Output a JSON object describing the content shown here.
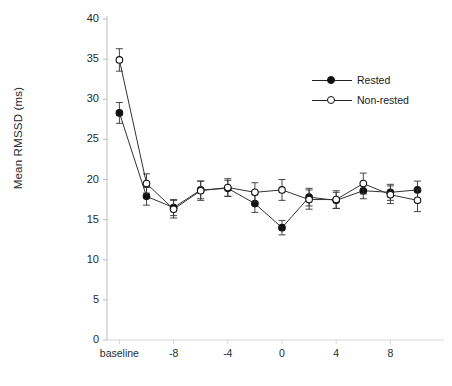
{
  "chart_data": {
    "type": "line",
    "title": "",
    "xlabel": "",
    "ylabel": "Mean RMSSD (ms)",
    "ylim": [
      0,
      40
    ],
    "yticks": [
      0,
      5,
      10,
      15,
      20,
      25,
      30,
      35,
      40
    ],
    "ytick_labels": [
      "0",
      "5",
      "10",
      "15",
      "20",
      "25",
      "30",
      "35",
      "40"
    ],
    "xtick_labels": [
      "baseline",
      "-8",
      "-4",
      "0",
      "4",
      "8"
    ],
    "xtick_values": [
      -12,
      -8,
      -4,
      0,
      4,
      8
    ],
    "x": [
      -12,
      -10,
      -8,
      -6,
      -4,
      -2,
      0,
      2,
      4,
      6,
      8,
      10
    ],
    "categories": [
      "baseline",
      "-10",
      "-8",
      "-6",
      "-4",
      "-2",
      "0",
      "2",
      "4",
      "6",
      "8",
      "10"
    ],
    "grid": false,
    "legend_position": "upper right",
    "error_bars": true,
    "series": [
      {
        "name": "Rested",
        "marker": "filled-circle",
        "color": "#111111",
        "values": [
          28.3,
          17.9,
          16.5,
          18.7,
          18.9,
          17.0,
          14.0,
          17.8,
          17.4,
          18.6,
          18.4,
          18.7
        ],
        "errors": [
          1.3,
          1.1,
          1.0,
          1.1,
          1.0,
          1.1,
          0.9,
          1.1,
          1.0,
          1.0,
          1.0,
          1.1
        ]
      },
      {
        "name": "Non-rested",
        "marker": "open-circle",
        "color": "#111111",
        "values": [
          34.9,
          19.5,
          16.3,
          18.6,
          19.0,
          18.4,
          18.7,
          17.5,
          17.5,
          19.5,
          18.1,
          17.4
        ],
        "errors": [
          1.4,
          1.2,
          1.1,
          1.2,
          1.1,
          1.2,
          1.3,
          1.2,
          1.1,
          1.3,
          1.1,
          1.4
        ]
      }
    ]
  },
  "legend": {
    "items": [
      {
        "label": "Rested",
        "marker": "filled-circle"
      },
      {
        "label": "Non-rested",
        "marker": "open-circle"
      }
    ]
  },
  "axes": {
    "ylabel": "Mean RMSSD (ms)"
  },
  "caption": {
    "text": ""
  }
}
